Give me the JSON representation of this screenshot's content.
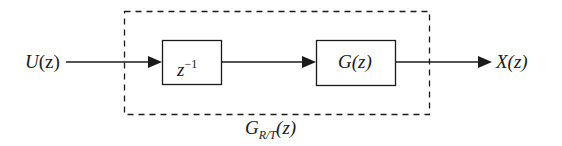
{
  "diagram": {
    "type": "block-diagram",
    "input": {
      "label": "U",
      "arg": "(z)"
    },
    "output": {
      "label": "X",
      "arg": "(z)"
    },
    "blocks": [
      {
        "id": "delay",
        "base": "z",
        "superscript": "−1"
      },
      {
        "id": "plant",
        "base": "G",
        "arg": "(z)"
      }
    ],
    "group": {
      "style": "dashed",
      "label_base": "G",
      "label_subscript": "R/T",
      "label_arg": "(z)"
    },
    "connections": [
      {
        "from": "U(z)",
        "to": "z^-1"
      },
      {
        "from": "z^-1",
        "to": "G(z)"
      },
      {
        "from": "G(z)",
        "to": "X(z)"
      }
    ],
    "colors": {
      "stroke": "#1a1a1a",
      "background": "#ffffff"
    }
  }
}
